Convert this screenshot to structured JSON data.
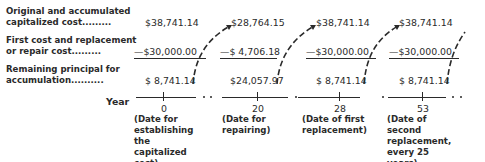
{
  "row_labels": {
    "row1_line1": "Original and accumulated",
    "row1_line2": "capitalized cost.........",
    "row2_line1": "First cost and replacement",
    "row2_line2": "or repair cost.........",
    "row3_line1": "Remaining principal for",
    "row3_line2": "accumulation..........",
    "year": "Year"
  },
  "columns": [
    {
      "capitalized": "$38,741.14",
      "cost": "—$30,000.00",
      "remaining": "$ 8,741.14",
      "year": "0",
      "note": "(Date for establishing the capitalized cost)"
    },
    {
      "capitalized": "$28,764.15",
      "cost": "—$ 4,706.18",
      "remaining": "$24,057.97",
      "year": "20",
      "note": "(Date for repairing)"
    },
    {
      "capitalized": "$38,741.14",
      "cost": "—$30,000.00",
      "remaining": "$ 8,741.14",
      "year": "28",
      "note": "(Date of first replacement)"
    },
    {
      "capitalized": "$38,741.14",
      "cost": "—$30,000.00",
      "remaining": "$ 8,741.14",
      "year": "53",
      "note": "(Date of second replacement, every 25 years)"
    }
  ]
}
